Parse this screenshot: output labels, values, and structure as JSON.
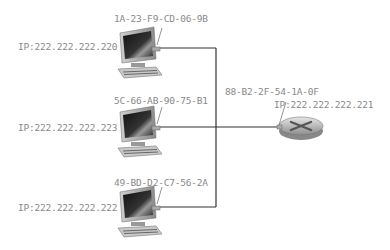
{
  "diagram": {
    "type": "network-bus-topology",
    "hosts": [
      {
        "mac": "1A-23-F9-CD-06-9B",
        "ip": "IP:222.222.222.220"
      },
      {
        "mac": "5C-66-AB-90-75-B1",
        "ip": "IP:222.222.222.223"
      },
      {
        "mac": "49-BD-D2-C7-56-2A",
        "ip": "IP:222.222.222.222"
      }
    ],
    "router": {
      "mac": "88-B2-2F-54-1A-0F",
      "ip": "IP:222.222.222.221"
    },
    "colors": {
      "line": "#333333",
      "label": "#8a8a8a"
    }
  }
}
